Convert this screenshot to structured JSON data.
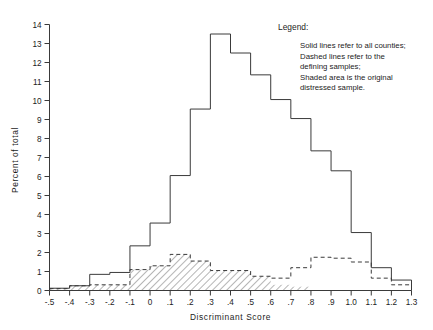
{
  "figure": {
    "clipped_header_text": "",
    "axis_color": "#3a3a3a"
  },
  "axes": {
    "x_title": "Discriminant Score",
    "y_title": "Percent of total",
    "x_ticks": [
      "-.5",
      "-.4",
      "-.3",
      "-.2",
      "-.1",
      "0",
      ".1",
      ".2",
      ".3",
      ".4",
      ".5",
      ".6",
      ".7",
      ".8",
      ".9",
      "1.0",
      "1.1",
      "1.2",
      "1.3"
    ],
    "y_ticks": [
      "0",
      "1",
      "2",
      "3",
      "4",
      "5",
      "6",
      "7",
      "8",
      "9",
      "10",
      "11",
      "12",
      "13",
      "14"
    ]
  },
  "legend": {
    "title": "Legend:",
    "lines": [
      "Solid lines refer  to all counties;",
      "Dashed lines refer  to the",
      "defining  samples;",
      "Shaded area is the original",
      "distressed sample."
    ]
  },
  "chart_data": {
    "type": "bar",
    "title": "",
    "xlabel": "Discriminant Score",
    "ylabel": "Percent of total",
    "xlim": [
      -0.5,
      1.3
    ],
    "ylim": [
      0,
      14
    ],
    "grid": false,
    "legend_position": "top-right",
    "bin_width": 0.1,
    "bin_starts": [
      -0.5,
      -0.4,
      -0.3,
      -0.2,
      -0.1,
      0.0,
      0.1,
      0.2,
      0.3,
      0.4,
      0.5,
      0.6,
      0.7,
      0.8,
      0.9,
      1.0,
      1.1,
      1.2
    ],
    "categories": [
      "-.5",
      "-.4",
      "-.3",
      "-.2",
      "-.1",
      "0",
      ".1",
      ".2",
      ".3",
      ".4",
      ".5",
      ".6",
      ".7",
      ".8",
      ".9",
      "1.0",
      "1.1",
      "1.2"
    ],
    "series": [
      {
        "name": "Solid lines refer to all counties",
        "style": "solid-outline",
        "values": [
          0.12,
          0.25,
          0.85,
          0.95,
          2.35,
          3.55,
          6.05,
          9.55,
          13.5,
          12.5,
          11.35,
          10.05,
          9.05,
          7.35,
          6.3,
          3.05,
          1.2,
          0.55
        ]
      },
      {
        "name": "Dashed lines refer to the defining samples",
        "style": "dashed-line",
        "values": [
          0.1,
          0.25,
          0.3,
          0.3,
          1.1,
          1.3,
          1.9,
          1.55,
          1.05,
          1.05,
          0.75,
          0.65,
          1.2,
          1.75,
          1.7,
          1.5,
          0.65,
          0.3
        ]
      },
      {
        "name": "Shaded area is the original distressed sample",
        "style": "hatched-area",
        "values": [
          0.1,
          0.25,
          0.3,
          0.3,
          1.1,
          1.3,
          1.9,
          1.55,
          1.05,
          1.05,
          0.75,
          0.3,
          0.2,
          0.0,
          0.0,
          0.0,
          0.0,
          0.0
        ]
      }
    ]
  }
}
